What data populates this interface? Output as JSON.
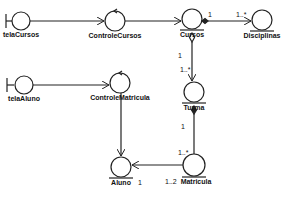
{
  "diagram": {
    "type": "UML robustness / analysis class diagram",
    "nodes": [
      {
        "id": "telaCursos",
        "label": "telaCursos",
        "stereotype": "boundary"
      },
      {
        "id": "ControleCursos",
        "label": "ControleCursos",
        "stereotype": "control"
      },
      {
        "id": "Cursos",
        "label": "Cursos",
        "stereotype": "entity"
      },
      {
        "id": "Disciplinas",
        "label": "Disciplinas",
        "stereotype": "entity"
      },
      {
        "id": "telaAluno",
        "label": "telaAluno",
        "stereotype": "boundary"
      },
      {
        "id": "ControleMatricula",
        "label": "ControleMatricula",
        "stereotype": "control"
      },
      {
        "id": "Turma",
        "label": "Turma",
        "stereotype": "entity"
      },
      {
        "id": "Aluno",
        "label": "Aluno",
        "stereotype": "entity"
      },
      {
        "id": "Matricula",
        "label": "Matricula",
        "stereotype": "entity"
      }
    ],
    "edges": [
      {
        "from": "telaCursos",
        "to": "ControleCursos",
        "kind": "navigable"
      },
      {
        "from": "ControleCursos",
        "to": "Cursos",
        "kind": "navigable"
      },
      {
        "from": "Cursos",
        "to": "Disciplinas",
        "kind": "composition",
        "source_mult": "1",
        "target_mult": "1..*"
      },
      {
        "from": "Cursos",
        "to": "Turma",
        "kind": "aggregation",
        "source_mult": "1",
        "target_mult": "1..*"
      },
      {
        "from": "telaAluno",
        "to": "ControleMatricula",
        "kind": "navigable"
      },
      {
        "from": "ControleMatricula",
        "to": "Aluno",
        "kind": "navigable"
      },
      {
        "from": "Turma",
        "to": "Matricula",
        "kind": "composition",
        "source_mult": "1",
        "target_mult": "1..*"
      },
      {
        "from": "Matricula",
        "to": "Aluno",
        "kind": "navigable",
        "source_mult": "1..2",
        "target_mult": "1"
      }
    ],
    "multiplicities": {
      "cursos_disc_src": "1",
      "cursos_disc_tgt": "1..*",
      "cursos_turma_src": "1",
      "cursos_turma_tgt": "1..*",
      "turma_matr_src": "1",
      "turma_matr_tgt": "1..*",
      "matr_aluno_src": "1..2",
      "matr_aluno_tgt": "1"
    }
  }
}
